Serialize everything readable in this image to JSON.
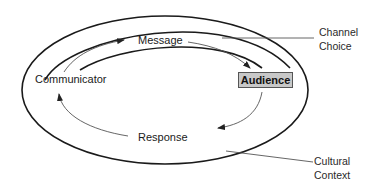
{
  "diagram": {
    "nodes": {
      "communicator": "Communicator",
      "message": "Message",
      "audience": "Audience",
      "response": "Response"
    },
    "annotations": {
      "channel_line1": "Channel",
      "channel_line2": "Choice",
      "culture_line1": "Cultural",
      "culture_line2": "Context"
    },
    "colors": {
      "stroke": "#1a1a1a",
      "arrow": "#555555",
      "audience_fill": "#c8c8c8"
    }
  }
}
